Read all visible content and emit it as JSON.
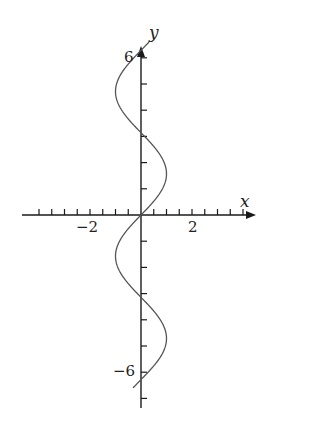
{
  "chart_data": {
    "type": "line",
    "title": "",
    "xlabel": "x",
    "ylabel": "y",
    "equation": "x = sin(y)",
    "xlim": [
      -4.2,
      4.4
    ],
    "ylim": [
      -8.2,
      6.6
    ],
    "x_ticks_step": 0.5,
    "y_ticks_step": 1,
    "x_tick_labels": [
      "-2",
      "2"
    ],
    "y_tick_labels": [
      "6",
      "-6"
    ],
    "grid": false,
    "legend": null,
    "series": [
      {
        "name": "x = sin(y)",
        "param_range": [
          -6.6,
          6.6
        ],
        "x": [
          0.311,
          0.0,
          -0.571,
          -0.959,
          -0.932,
          -0.479,
          0.0,
          0.479,
          0.932,
          0.959,
          0.571,
          0.0,
          -0.311,
          0.0,
          0.311,
          0.0,
          -0.571,
          -0.959,
          -0.932,
          -0.479,
          0.0,
          0.479,
          0.932,
          0.959,
          0.571,
          0.0,
          -0.311
        ],
        "y": [
          -6.6,
          -6.283,
          -5.67,
          -4.99,
          -4.33,
          -3.64,
          -3.1416,
          -2.64,
          -1.94,
          -1.28,
          -0.61,
          0.0,
          -0.32,
          0.0,
          0.32,
          0.0,
          0.61,
          1.28,
          1.94,
          2.64,
          3.1416,
          3.64,
          4.33,
          4.99,
          5.67,
          6.283,
          6.6
        ]
      }
    ]
  },
  "labels": {
    "x_axis": "x",
    "y_axis": "y",
    "tick_neg2": "−2",
    "tick_pos2": "2",
    "tick_pos6": "6",
    "tick_neg6": "−6"
  },
  "colors": {
    "axis": "#1a1a1a",
    "curve": "#555555"
  }
}
